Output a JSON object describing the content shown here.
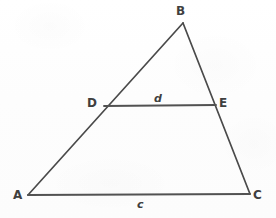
{
  "figure": {
    "background_color": "#fefefe",
    "stroke_color": "#4a4a4a",
    "text_color": "#3f3f3f",
    "stroke_width": 1.6
  },
  "vertices": [
    {
      "id": "B",
      "label": "B",
      "x": 183,
      "y": 23,
      "label_x": 176,
      "label_y": 5
    },
    {
      "id": "A",
      "label": "A",
      "x": 28,
      "y": 195,
      "label_x": 13,
      "label_y": 189
    },
    {
      "id": "C",
      "label": "C",
      "x": 250,
      "y": 194,
      "label_x": 253,
      "label_y": 189
    },
    {
      "id": "D",
      "label": "D",
      "x": 104,
      "y": 106,
      "label_x": 87,
      "label_y": 97
    },
    {
      "id": "E",
      "label": "E",
      "x": 216,
      "y": 105,
      "label_x": 219,
      "label_y": 97
    }
  ],
  "edges": [
    {
      "id": "AB",
      "from": "A",
      "to": "B",
      "x1": 28,
      "y1": 195,
      "x2": 183,
      "y2": 23
    },
    {
      "id": "BC",
      "from": "B",
      "to": "C",
      "x1": 183,
      "y1": 23,
      "x2": 250,
      "y2": 194
    },
    {
      "id": "AC",
      "from": "A",
      "to": "C",
      "x1": 28,
      "y1": 195,
      "x2": 250,
      "y2": 194
    },
    {
      "id": "DE",
      "from": "D",
      "to": "E",
      "x1": 104,
      "y1": 106,
      "x2": 216,
      "y2": 105
    }
  ],
  "side_labels": [
    {
      "id": "d",
      "label": "d",
      "for_edge": "DE",
      "x": 154,
      "y": 93
    },
    {
      "id": "c",
      "label": "c",
      "for_edge": "AC",
      "x": 137,
      "y": 199
    }
  ]
}
